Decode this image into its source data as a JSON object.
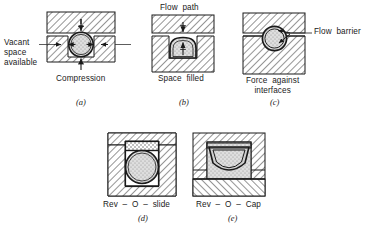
{
  "figure": {
    "kind": "engineering-cross-section-diagram",
    "colors": {
      "line": "#1a1a1a",
      "hatch": "#333333",
      "metal_fill": "#ffffff",
      "elastomer_fill": "#d8d8d8",
      "elastomer_stipple": "#b9b9b9",
      "leader": "#333333",
      "background": "#ffffff"
    }
  },
  "panels": [
    {
      "id": "a",
      "caption": "(a)",
      "annotations": {
        "left_label": "Vacant\nspace\navailable",
        "bottom_label": "Compression"
      },
      "seal_shape": "circle",
      "description": "Round O-ring in groove, vertical compression arrows and lateral vacant space arrows"
    },
    {
      "id": "b",
      "caption": "(b)",
      "annotations": {
        "top_label": "Flow path",
        "bottom_label": "Space filled"
      },
      "seal_shape": "squared-dome",
      "description": "O-ring deformed to fill groove, upward pressure arrow"
    },
    {
      "id": "c",
      "caption": "(c)",
      "annotations": {
        "right_label": "Flow barrier",
        "bottom_label": "Force against\ninterfaces"
      },
      "seal_shape": "circle",
      "description": "O-ring pressed into gap forming flow barrier"
    },
    {
      "id": "d",
      "caption": "(d)",
      "annotations": {
        "bottom_label": "Rev – O – slide"
      },
      "seal_shape": "circle-with-slide-ring",
      "description": "O-ring energizing a slide ring above it"
    },
    {
      "id": "e",
      "caption": "(e)",
      "annotations": {
        "bottom_label": "Rev – O – Cap"
      },
      "seal_shape": "half-dome-cap",
      "description": "O-ring with cap seal in groove"
    }
  ],
  "labels": {
    "vacant_space_available": "Vacant\nspace\navailable",
    "compression": "Compression",
    "flow_path": "Flow  path",
    "space_filled": "Space  filled",
    "flow_barrier": "Flow  barrier",
    "force_against_interfaces": "Force  against\ninterfaces",
    "rev_o_slide": "Rev  –  O  –  slide",
    "rev_o_cap": "Rev  –  O  –  Cap",
    "caption_a": "(a)",
    "caption_b": "(b)",
    "caption_c": "(c)",
    "caption_d": "(d)",
    "caption_e": "(e)"
  }
}
